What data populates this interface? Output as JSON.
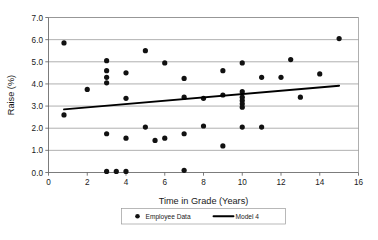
{
  "chart_data": {
    "type": "scatter",
    "title": "",
    "xlabel": "Time in Grade (Years)",
    "ylabel": "Raise (%)",
    "xlim": [
      0,
      16
    ],
    "ylim": [
      0,
      7
    ],
    "xticks": [
      0,
      2,
      4,
      6,
      8,
      10,
      12,
      14,
      16
    ],
    "xtick_labels": [
      "0",
      "2",
      "4",
      "6",
      "8",
      "10",
      "12",
      "14",
      "16"
    ],
    "yticks": [
      0,
      1,
      2,
      3,
      4,
      5,
      6,
      7
    ],
    "ytick_labels": [
      "0.0",
      "1.0",
      "2.0",
      "3.0",
      "4.0",
      "5.0",
      "6.0",
      "7.0"
    ],
    "grid": "horizontal",
    "legend_position": "bottom-center",
    "series": [
      {
        "name": "Employee Data",
        "type": "scatter",
        "marker": "circle",
        "color": "#111111",
        "points": [
          [
            0.8,
            5.85
          ],
          [
            0.8,
            2.6
          ],
          [
            2.0,
            3.75
          ],
          [
            3.0,
            5.05
          ],
          [
            3.0,
            4.6
          ],
          [
            3.0,
            4.3
          ],
          [
            3.0,
            4.05
          ],
          [
            3.0,
            1.75
          ],
          [
            3.0,
            0.05
          ],
          [
            3.5,
            0.05
          ],
          [
            4.0,
            4.5
          ],
          [
            4.0,
            3.35
          ],
          [
            4.0,
            1.55
          ],
          [
            4.0,
            0.05
          ],
          [
            5.0,
            5.5
          ],
          [
            5.0,
            2.05
          ],
          [
            5.5,
            1.45
          ],
          [
            6.0,
            4.95
          ],
          [
            6.0,
            1.55
          ],
          [
            7.0,
            4.25
          ],
          [
            7.0,
            3.4
          ],
          [
            7.0,
            1.75
          ],
          [
            7.0,
            0.1
          ],
          [
            8.0,
            3.35
          ],
          [
            8.0,
            2.1
          ],
          [
            9.0,
            4.6
          ],
          [
            9.0,
            3.5
          ],
          [
            9.0,
            1.2
          ],
          [
            10.0,
            4.95
          ],
          [
            10.0,
            3.65
          ],
          [
            10.0,
            3.4
          ],
          [
            10.0,
            3.25
          ],
          [
            10.0,
            3.1
          ],
          [
            10.0,
            2.95
          ],
          [
            10.0,
            2.05
          ],
          [
            11.0,
            4.3
          ],
          [
            11.0,
            2.05
          ],
          [
            12.0,
            4.3
          ],
          [
            12.5,
            5.1
          ],
          [
            13.0,
            3.4
          ],
          [
            14.0,
            4.45
          ],
          [
            15.0,
            6.05
          ]
        ]
      },
      {
        "name": "Model 4",
        "type": "line",
        "color": "#000000",
        "points": [
          [
            0.8,
            2.85
          ],
          [
            15.0,
            3.92
          ]
        ]
      }
    ]
  },
  "legend": {
    "entries": [
      {
        "label": "Employee Data",
        "marker": "circle"
      },
      {
        "label": "Model 4",
        "marker": "line"
      }
    ]
  }
}
